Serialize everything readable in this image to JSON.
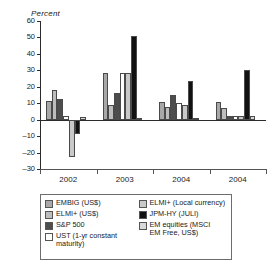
{
  "chart_data": {
    "type": "bar",
    "title": "",
    "subtitle": "",
    "xlabel": "",
    "ylabel": "Percent",
    "ylim": [
      -30,
      60
    ],
    "ytick_step": 10,
    "yticks": [
      60,
      50,
      40,
      30,
      20,
      10,
      0,
      -10,
      -20,
      -30
    ],
    "ytick_labels": [
      "60",
      "50",
      "40",
      "30",
      "20",
      "10",
      "0",
      "–10",
      "–20",
      "–30"
    ],
    "grid": false,
    "legend_position": "below-plot",
    "categories": [
      "2002",
      "2003",
      "2004",
      "2004"
    ],
    "series": [
      {
        "name": "EMBIG (US$)",
        "color": "#a8a8a8",
        "values": [
          11.5,
          28.5,
          11.0,
          10.5
        ]
      },
      {
        "name": "ELMI+ (US$)",
        "color": "#bdbdbd",
        "values": [
          18.0,
          9.0,
          8.0,
          7.0
        ]
      },
      {
        "name": "S&P 500",
        "color": "#4d4d4d",
        "values": [
          12.5,
          16.5,
          15.0,
          2.5
        ]
      },
      {
        "name": "UST (1-yr constant maturity)",
        "color": "#ffffff",
        "values": [
          2.5,
          28.5,
          10.0,
          2.0
        ]
      },
      {
        "name": "ELMI+ (Local currency)",
        "color": "#c9c9c9",
        "values": [
          -22.5,
          28.5,
          9.0,
          2.5
        ]
      },
      {
        "name": "JPM-HY (JULI)",
        "color": "#111111",
        "values": [
          -9.0,
          51.0,
          23.5,
          30.0
        ]
      },
      {
        "name": "EM equities (MSCI EM Free, US$)",
        "color": "#d9d9d9",
        "values": [
          1.5,
          1.0,
          1.0,
          2.5
        ]
      }
    ]
  },
  "axis": {
    "y_title": "Percent"
  },
  "legend": {
    "column_a": [
      {
        "label": "EMBIG (US$)",
        "swatch": "#a8a8a8"
      },
      {
        "label": "ELMI+ (US$)",
        "swatch": "#bdbdbd"
      },
      {
        "label": "S&P 500",
        "swatch": "#4d4d4d"
      },
      {
        "label": "UST (1-yr constant\nmaturity)",
        "swatch": "#ffffff"
      }
    ],
    "column_b": [
      {
        "label": "ELMI+ (Local currency)",
        "swatch": "#c9c9c9"
      },
      {
        "label": "JPM-HY (JULI)",
        "swatch": "#111111"
      },
      {
        "label": "EM equities (MSCI\nEM Free, US$)",
        "swatch": "#d9d9d9"
      }
    ]
  }
}
